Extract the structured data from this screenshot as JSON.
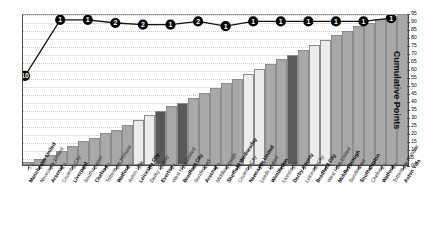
{
  "chart_data": {
    "type": "bar",
    "title": "",
    "xlabel": "",
    "ylabel": "Cumulative Points",
    "ylim": [
      0,
      95
    ],
    "ytick_step": 5,
    "yticks": [
      95,
      90,
      85,
      80,
      75,
      70,
      65,
      60,
      55,
      50,
      45,
      40,
      35,
      30,
      25,
      20,
      15,
      10,
      5,
      0
    ],
    "grid": true,
    "legend_position": "none",
    "categories": [
      "Manchester United",
      "Newcastle United",
      "Arsenal",
      "Coventry City",
      "Liverpool",
      "Southampton",
      "Chelsea",
      "Tottenham Hotspur",
      "Watford",
      "Aston Villa",
      "Leicester City",
      "Derby County",
      "Everton",
      "West Ham United",
      "Bradford City",
      "Sunderland",
      "Arsenal",
      "Middlesbrough",
      "Sheffield Wednesday",
      "Coventry City",
      "Newcastle United",
      "Leeds United",
      "Wimbledon",
      "Liverpool",
      "Derby County",
      "Leicester City",
      "Bradford City",
      "West Ham United",
      "Middlesbrough",
      "Sunderland",
      "Southampton",
      "Chelsea",
      "Watford",
      "Tottenham Hotspur",
      "Aston Villa"
    ],
    "category_values": [
      "1.1",
      "0.8",
      "2.1",
      "3.2",
      "1.1",
      "2.2",
      "0.5",
      "1.2",
      "0.5",
      "4.1",
      "1.3",
      "2.2",
      "2.1",
      "2.1",
      "1.2",
      "4.2",
      "4.0",
      "2.3",
      "1.1",
      "2.1",
      "1.0",
      "2.2",
      "3.2",
      "0.3",
      "1.9",
      "2.2",
      "1.2",
      "2.3",
      "2.0",
      "2.0",
      "4.0",
      "2.1",
      "2.1",
      "3.9",
      "1.0"
    ],
    "values": [
      2,
      4,
      6,
      9,
      12,
      15,
      17,
      20,
      22,
      25,
      28,
      31,
      34,
      37,
      39,
      42,
      45,
      48,
      51,
      54,
      57,
      60,
      63,
      66,
      69,
      72,
      75,
      78,
      81,
      84,
      87,
      89,
      91,
      93,
      95
    ],
    "bar_shades": [
      "mid",
      "mid",
      "mid",
      "mid",
      "mid",
      "mid",
      "mid",
      "mid",
      "mid",
      "mid",
      "light",
      "light",
      "dark",
      "mid",
      "dark",
      "mid",
      "mid",
      "mid",
      "mid",
      "mid",
      "light",
      "light",
      "mid",
      "mid",
      "dark",
      "mid",
      "light",
      "light",
      "mid",
      "mid",
      "mid",
      "mid",
      "mid",
      "mid",
      "mid"
    ],
    "line_series": {
      "name": "Points",
      "labels": [
        "10",
        "1",
        "1",
        "2",
        "2",
        "1",
        "2",
        "1",
        "1",
        "1",
        "1",
        "1",
        "1",
        "1"
      ],
      "values": [
        57,
        92,
        92,
        90,
        89,
        89,
        91,
        88,
        91,
        91,
        91,
        91,
        91,
        93
      ]
    }
  },
  "colors": {
    "bar_mid": "#a8a8a8",
    "bar_light": "#ececec",
    "bar_dark": "#595959",
    "bar_border": "#8d8d8d",
    "line": "#111111",
    "marker_fill": "#000000",
    "marker_text": "#ffffff",
    "axis": "#4a4a4a",
    "grid": "#c9c9c9",
    "background": "#ffffff"
  }
}
